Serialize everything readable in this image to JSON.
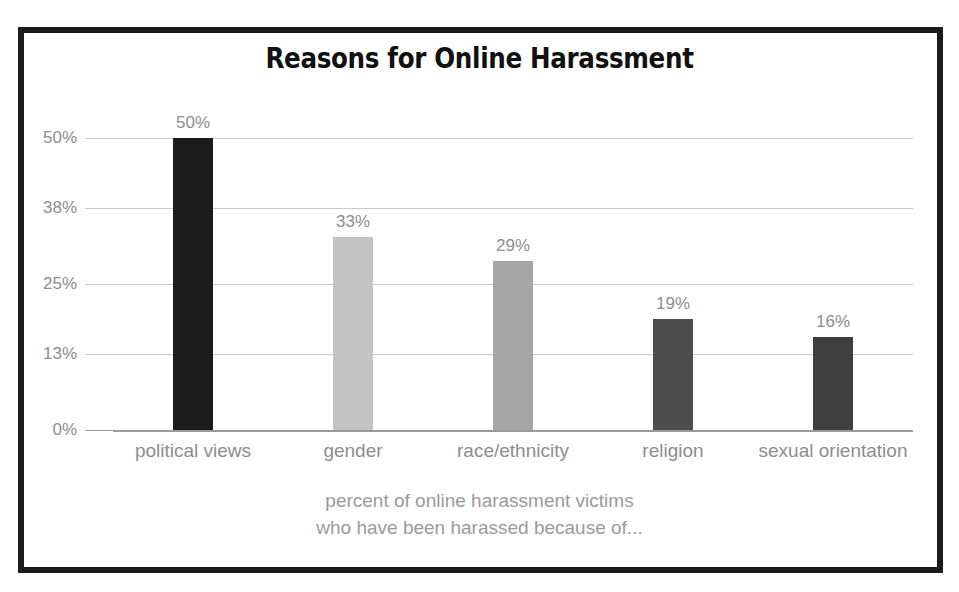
{
  "chart_data": {
    "type": "bar",
    "title": "Reasons for Online Harassment",
    "subtitle": "",
    "categories": [
      "political views",
      "gender",
      "race/ethnicity",
      "religion",
      "sexual orientation"
    ],
    "values": [
      50,
      33,
      29,
      19,
      16
    ],
    "value_labels": [
      "50%",
      "33%",
      "29%",
      "19%",
      "16%"
    ],
    "bar_colors": [
      "#1c1c1c",
      "#c3c3c3",
      "#a6a6a6",
      "#4d4d4d",
      "#3f3f3f"
    ],
    "xlabel": "",
    "ylabel": "",
    "ylim": [
      0,
      50
    ],
    "ytick_values": [
      0,
      13,
      25,
      38,
      50
    ],
    "ytick_labels": [
      "0%",
      "13%",
      "25%",
      "38%",
      "50%"
    ],
    "grid": true,
    "legend": "none",
    "caption_lines": [
      "percent of online harassment victims",
      "who have been harassed because of..."
    ],
    "colors": {
      "frame": "#1b1b1b",
      "gridline": "#c9c9c9",
      "baseline": "#9a9a9a",
      "tick_text": "#8d8d8d",
      "caption_text": "#9a9a9a",
      "title_text": "#111111",
      "background": "#ffffff"
    }
  }
}
